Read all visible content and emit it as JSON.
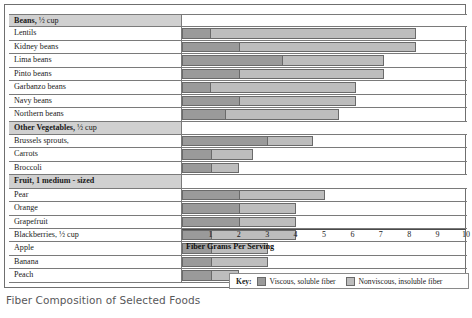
{
  "caption": "Fiber Composition of Selected Foods",
  "axis": {
    "title": "Fiber Grams Per Serving",
    "ticks": [
      "1",
      "2",
      "3",
      "4",
      "5",
      "6",
      "7",
      "8",
      "9",
      "10"
    ],
    "min": 0,
    "max": 10
  },
  "legend": {
    "key_label": "Key:",
    "items": [
      {
        "label": "Viscous, soluble fiber",
        "color": "#9a9a9a"
      },
      {
        "label": "Nonviscous, insoluble fiber",
        "color": "#bdbdbd"
      }
    ]
  },
  "chart_data": {
    "type": "bar",
    "orientation": "horizontal",
    "stacked": true,
    "title": "Fiber Composition of Selected Foods",
    "xlabel": "Fiber Grams Per Serving",
    "ylabel": "",
    "xlim": [
      0,
      10
    ],
    "grid": true,
    "legend_position": "bottom-right",
    "series": [
      {
        "name": "Viscous, soluble fiber",
        "color": "#9a9a9a"
      },
      {
        "name": "Nonviscous, insoluble fiber",
        "color": "#bdbdbd"
      }
    ],
    "groups": [
      {
        "group": "Beans, ½ cup",
        "group_bold": "Beans,",
        "group_sub": " ½ cup",
        "rows": [
          {
            "label": "Lentils",
            "soluble": 1.0,
            "insoluble": 7.2,
            "total": 8.2
          },
          {
            "label": "Kidney beans",
            "soluble": 2.0,
            "insoluble": 6.2,
            "total": 8.2
          },
          {
            "label": "Lima beans",
            "soluble": 3.5,
            "insoluble": 3.6,
            "total": 7.1
          },
          {
            "label": "Pinto beans",
            "soluble": 2.0,
            "insoluble": 5.1,
            "total": 7.1
          },
          {
            "label": "Garbanzo beans",
            "soluble": 1.0,
            "insoluble": 5.1,
            "total": 6.1
          },
          {
            "label": "Navy beans",
            "soluble": 2.0,
            "insoluble": 4.1,
            "total": 6.1
          },
          {
            "label": "Northern beans",
            "soluble": 1.5,
            "insoluble": 4.0,
            "total": 5.5
          }
        ]
      },
      {
        "group": "Other Vegetables, ½ cup",
        "group_bold": "Other Vegetables,",
        "group_sub": " ½ cup",
        "rows": [
          {
            "label": "Brussels sprouts,",
            "soluble": 3.0,
            "insoluble": 1.6,
            "total": 4.6
          },
          {
            "label": "Carrots",
            "soluble": 1.0,
            "insoluble": 1.5,
            "total": 2.5
          },
          {
            "label": "Broccoli",
            "soluble": 1.0,
            "insoluble": 1.0,
            "total": 2.0
          }
        ]
      },
      {
        "group": "Fruit, 1 medium - sized",
        "group_bold": "Fruit, 1 medium - sized",
        "group_sub": "",
        "rows": [
          {
            "label": "Pear",
            "soluble": 2.0,
            "insoluble": 3.0,
            "total": 5.0
          },
          {
            "label": "Orange",
            "soluble": 2.0,
            "insoluble": 2.0,
            "total": 4.0
          },
          {
            "label": "Grapefruit",
            "soluble": 2.0,
            "insoluble": 2.0,
            "total": 4.0
          },
          {
            "label": "Blackberries, ½ cup",
            "soluble": 1.0,
            "insoluble": 3.0,
            "total": 4.0
          },
          {
            "label": "Apple",
            "soluble": 1.0,
            "insoluble": 2.0,
            "total": 3.0
          },
          {
            "label": "Banana",
            "soluble": 1.0,
            "insoluble": 2.0,
            "total": 3.0
          },
          {
            "label": "Peach",
            "soluble": 1.0,
            "insoluble": 1.0,
            "total": 2.0
          }
        ]
      }
    ]
  }
}
